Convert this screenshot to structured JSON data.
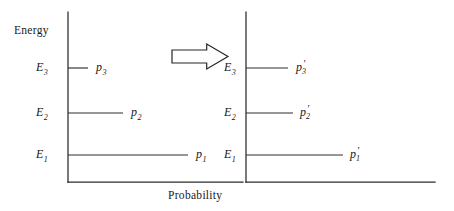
{
  "figure": {
    "type": "two-panel-line-diagram",
    "width": 454,
    "height": 211,
    "background_color": "#ffffff",
    "ink_color": "#2b2b2b"
  },
  "axes": {
    "y_axis_label": "Energy",
    "x_axis_label": "Probability"
  },
  "chart_data": {
    "type": "bar",
    "title": "",
    "subtitle": "",
    "xlabel": "Probability",
    "ylabel": "Energy",
    "orientation": "horizontal",
    "grid": false,
    "legend": false,
    "panels": [
      {
        "name": "left-panel",
        "description": "initial probability distribution over energy levels",
        "categories": [
          "E_1",
          "E_2",
          "E_3"
        ],
        "category_labels": [
          "E",
          "E",
          "E"
        ],
        "category_subscripts": [
          "1",
          "2",
          "3"
        ],
        "value_labels": [
          "p_1",
          "p_2",
          "p_3"
        ],
        "value_label_base": "p",
        "value_label_subscripts": [
          "1",
          "2",
          "3"
        ],
        "values": [
          120,
          55,
          20
        ],
        "axis_x": 68,
        "axis_top_y": 12,
        "axis_bottom_y": 182,
        "axis_right_x": 243,
        "levels": [
          {
            "label_base": "E",
            "sub": "1",
            "y": 155,
            "x_start": 68,
            "x_end": 188,
            "value_base": "p",
            "value_sub": "1",
            "value_prime": false,
            "label_x": 196,
            "label_y": 148
          },
          {
            "label_base": "E",
            "sub": "2",
            "y": 113,
            "x_start": 68,
            "x_end": 123,
            "value_base": "p",
            "value_sub": "2",
            "value_prime": false,
            "label_x": 131,
            "label_y": 106
          },
          {
            "label_base": "E",
            "sub": "3",
            "y": 68,
            "x_start": 68,
            "x_end": 88,
            "value_base": "p",
            "value_sub": "3",
            "value_prime": false,
            "label_x": 96,
            "label_y": 61
          }
        ]
      },
      {
        "name": "right-panel",
        "description": "broadened probability distribution over energy levels after transition",
        "categories": [
          "E_1",
          "E_2",
          "E_3"
        ],
        "category_labels": [
          "E",
          "E",
          "E"
        ],
        "category_subscripts": [
          "1",
          "2",
          "3"
        ],
        "value_labels": [
          "p'_1",
          "p'_2",
          "p'_3"
        ],
        "value_label_base": "p",
        "value_label_subscripts": [
          "1",
          "2",
          "3"
        ],
        "values": [
          140,
          95,
          60
        ],
        "axis_x": 246,
        "axis_top_y": 12,
        "axis_bottom_y": 182,
        "axis_right_x": 435,
        "levels": [
          {
            "label_base": "E",
            "sub": "1",
            "y": 155,
            "x_start": 246,
            "x_end": 343,
            "value_base": "p",
            "value_sub": "1",
            "value_prime": true,
            "label_x": 350,
            "label_y": 148
          },
          {
            "label_base": "E",
            "sub": "2",
            "y": 113,
            "x_start": 246,
            "x_end": 293,
            "value_base": "p",
            "value_sub": "2",
            "value_prime": true,
            "label_x": 300,
            "label_y": 106
          },
          {
            "label_base": "E",
            "sub": "3",
            "y": 68,
            "x_start": 246,
            "x_end": 288,
            "value_base": "p",
            "value_sub": "3",
            "value_prime": true,
            "label_x": 296,
            "label_y": 61
          }
        ]
      }
    ],
    "annotations": [
      {
        "name": "transition-arrow",
        "kind": "block-arrow-right",
        "x": 172,
        "y": 44,
        "width": 56,
        "height": 25,
        "fill": "#ffffff",
        "stroke": "#262626"
      }
    ]
  },
  "labels": {
    "left": {
      "energy_axis": "Energy",
      "probability_axis": "Probability",
      "E3": {
        "base": "E",
        "sub": "3"
      },
      "E2": {
        "base": "E",
        "sub": "2"
      },
      "E1": {
        "base": "E",
        "sub": "1"
      },
      "p3": {
        "base": "p",
        "sub": "3"
      },
      "p2": {
        "base": "p",
        "sub": "2"
      },
      "p1": {
        "base": "p",
        "sub": "1"
      }
    },
    "right": {
      "E3": {
        "base": "E",
        "sub": "3"
      },
      "E2": {
        "base": "E",
        "sub": "2"
      },
      "E1": {
        "base": "E",
        "sub": "1"
      },
      "p3": {
        "base": "p",
        "sub": "3",
        "prime": "′"
      },
      "p2": {
        "base": "p",
        "sub": "2",
        "prime": "′"
      },
      "p1": {
        "base": "p",
        "sub": "1",
        "prime": "′"
      }
    }
  }
}
